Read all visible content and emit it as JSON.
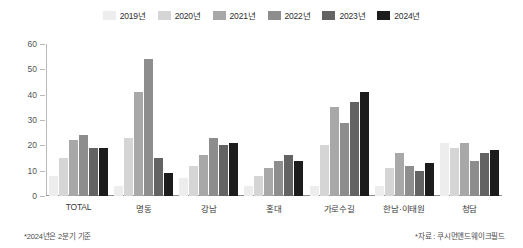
{
  "chart_data": {
    "type": "bar",
    "title": "",
    "xlabel": "",
    "ylabel": "",
    "ylim": [
      0,
      60
    ],
    "yticks": [
      0,
      10,
      20,
      30,
      40,
      50,
      60
    ],
    "grid": false,
    "legend_position": "top-center",
    "categories": [
      "TOTAL",
      "명동",
      "강남",
      "홍대",
      "가로수길",
      "한남·이태원",
      "청담"
    ],
    "series": [
      {
        "name": "2019년",
        "color": "#ededed",
        "values": [
          8,
          4,
          7,
          4,
          4,
          4,
          21
        ]
      },
      {
        "name": "2020년",
        "color": "#d5d5d5",
        "values": [
          15,
          23,
          12,
          8,
          20,
          11,
          19
        ]
      },
      {
        "name": "2021년",
        "color": "#a8a8a8",
        "values": [
          22,
          41,
          16,
          11,
          35,
          17,
          21
        ]
      },
      {
        "name": "2022년",
        "color": "#8d8d8d",
        "values": [
          24,
          54,
          23,
          14,
          29,
          12,
          14
        ]
      },
      {
        "name": "2023년",
        "color": "#636363",
        "values": [
          19,
          15,
          20,
          16,
          37,
          10,
          17
        ]
      },
      {
        "name": "2024년",
        "color": "#1c1c1c",
        "values": [
          19,
          9,
          21,
          14,
          41,
          13,
          18
        ]
      }
    ]
  },
  "footnotes": {
    "left": "*2024년은 2분기 기준",
    "right": "*자료 : 쿠시먼앤드웨이크필드"
  }
}
